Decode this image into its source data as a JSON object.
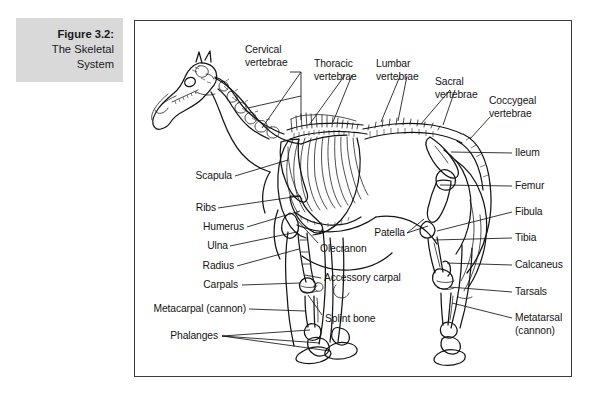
{
  "figure": {
    "caption_title": "Figure 3.2:",
    "caption_line2": "The Skeletal",
    "caption_line3": "System",
    "caption_bg": "#d9d9d9",
    "frame_color": "#3a3a3a",
    "ink_color": "#141414",
    "background": "#ffffff"
  },
  "labels": {
    "cervical_1": "Cervical",
    "cervical_2": "vertebrae",
    "thoracic_1": "Thoracic",
    "thoracic_2": "vertebrae",
    "lumbar_1": "Lumbar",
    "lumbar_2": "vertebrae",
    "sacral_1": "Sacral",
    "sacral_2": "vertebrae",
    "coccygeal_1": "Coccygeal",
    "coccygeal_2": "vertebrae",
    "scapula": "Scapula",
    "ribs": "Ribs",
    "humerus": "Humerus",
    "ulna": "Ulna",
    "radius": "Radius",
    "carpals": "Carpals",
    "metacarpal": "Metacarpal (cannon)",
    "phalanges": "Phalanges",
    "olecranon": "Olecranon",
    "accessory_carpal": "Accessory carpal",
    "splint_bone": "Splint bone",
    "patella": "Patella",
    "ileum": "Ileum",
    "femur": "Femur",
    "fibula": "Fibula",
    "tibia": "Tibia",
    "calcaneus": "Calcaneus",
    "tarsals": "Tarsals",
    "metatarsal_1": "Metatarsal",
    "metatarsal_2": "(cannon)"
  },
  "subject": {
    "name": "horse-skeleton-lateral-view",
    "description": "Lateral line drawing of an equine skeleton facing left"
  }
}
